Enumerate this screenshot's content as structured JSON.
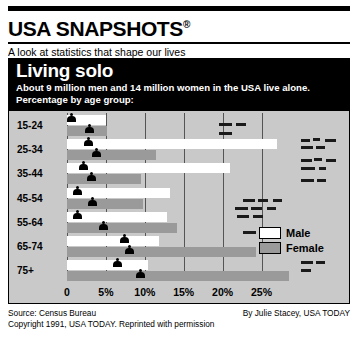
{
  "masthead": {
    "title": "USA SNAPSHOTS",
    "registered_mark": "®",
    "tagline": "A look at statistics that shape our lives"
  },
  "banner": {
    "title": "Living solo",
    "description": "About 9 million men and 14 million women in the USA live alone. Percentage by age group:"
  },
  "legend": {
    "items": [
      {
        "label": "Male",
        "color": "#ffffff"
      },
      {
        "label": "Female",
        "color": "#9a9a9a"
      }
    ]
  },
  "footer": {
    "source": "Source: Census Bureau",
    "credit": "By Julie Stacey, USA TODAY",
    "copyright": "Copyright 1991, USA TODAY. Reprinted with permission"
  },
  "chart_data": {
    "type": "bar",
    "orientation": "horizontal",
    "title": "Living solo",
    "subtitle": "About 9 million men and 14 million women in the USA live alone. Percentage by age group:",
    "xlabel": "",
    "ylabel": "",
    "categories": [
      "15-24",
      "25-34",
      "35-44",
      "45-54",
      "55-64",
      "65-74",
      "75+"
    ],
    "series": [
      {
        "name": "Male",
        "color": "#ffffff",
        "values": [
          5.0,
          27.0,
          21.0,
          13.3,
          12.8,
          11.8,
          10.4
        ]
      },
      {
        "name": "Female",
        "color": "#9a9a9a",
        "values": [
          5.1,
          11.4,
          9.5,
          9.8,
          14.1,
          24.3,
          28.5
        ]
      }
    ],
    "xlim": [
      0,
      29
    ],
    "xticks": [
      0,
      5,
      10,
      15,
      20,
      25
    ],
    "xticklabels": [
      "0",
      "5%",
      "10%",
      "15%",
      "20%",
      "25%"
    ],
    "grid": true,
    "legend_position": "right"
  }
}
